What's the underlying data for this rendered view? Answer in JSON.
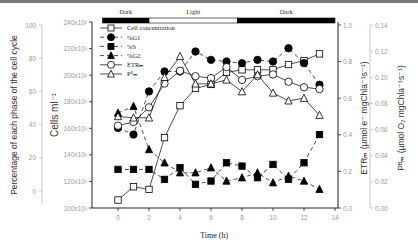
{
  "chart_data": {
    "type": "line",
    "title": "",
    "xlabel": "Time (h)",
    "x": [
      0,
      1,
      2,
      3,
      4,
      5,
      6,
      7,
      8,
      9,
      10,
      11,
      12,
      13
    ],
    "xlim": [
      -1,
      14
    ],
    "xticks": [
      "0",
      "2",
      "4",
      "6",
      "8",
      "10",
      "12",
      "14"
    ],
    "period_bar": [
      {
        "label": "Dark",
        "from": -1,
        "to": 2,
        "color": "#000000"
      },
      {
        "label": "Light",
        "from": 2,
        "to": 7.7,
        "color": "#ffffff"
      },
      {
        "label": "Dark",
        "from": 7.7,
        "to": 14,
        "color": "#000000"
      }
    ],
    "axes": {
      "percentage": {
        "label": "Percentage of each phase of the cell cycle",
        "ylim": [
          0,
          100
        ],
        "ticks": [
          "0",
          "20",
          "40",
          "60",
          "80",
          "100"
        ]
      },
      "cells": {
        "label": "Cells ml⁻¹",
        "ylim": [
          100000,
          240000
        ],
        "ticks": [
          "100x10³",
          "120x10³",
          "140x10³",
          "160x10³",
          "180x10³",
          "200x10³",
          "220x10³",
          "240x10³"
        ]
      },
      "etr": {
        "label": "ETRₘ (μmol e⁻ mgChla⁻¹s⁻¹)",
        "ylim": [
          0,
          1.0
        ],
        "ticks": [
          "0.0",
          "0.2",
          "0.4",
          "0.6",
          "0.8",
          "1.0"
        ]
      },
      "pbm": {
        "label": "Pᴮₘ (μmol O₂ mgChla⁻¹s⁻¹)",
        "ylim": [
          0,
          0.14
        ],
        "ticks": [
          "0.00",
          "0.02",
          "0.04",
          "0.06",
          "0.08",
          "0.10",
          "0.12",
          "0.14"
        ]
      }
    },
    "series": [
      {
        "name": "Cell concentration",
        "axis": "cells",
        "marker": "open-square",
        "line": "solid",
        "values": [
          106000,
          116000,
          114000,
          153000,
          177000,
          190000,
          193000,
          202000,
          204000,
          204000,
          204000,
          208000,
          211000,
          216000
        ]
      },
      {
        "name": "%G1",
        "axis": "percentage",
        "marker": "filled-circle",
        "line": "dashed",
        "values": [
          38,
          34,
          60,
          72,
          72,
          84,
          79,
          78,
          77,
          79,
          78,
          86,
          77,
          64
        ]
      },
      {
        "name": "%S",
        "axis": "percentage",
        "marker": "filled-square",
        "line": "dashed",
        "values": [
          13,
          13,
          13,
          7,
          14,
          4,
          6,
          17,
          15,
          8,
          16,
          7,
          17,
          34
        ]
      },
      {
        "name": "%G2",
        "axis": "percentage",
        "marker": "filled-triangle",
        "line": "dashed",
        "values": [
          47,
          51,
          25,
          17,
          11,
          11,
          14,
          6,
          8,
          11,
          5,
          9,
          6,
          1
        ]
      },
      {
        "name": "ETRₘ",
        "axis": "etr",
        "marker": "open-circle",
        "line": "solid",
        "values": [
          0.45,
          0.47,
          0.55,
          0.68,
          0.75,
          0.72,
          0.71,
          0.77,
          0.7,
          0.72,
          0.73,
          0.69,
          0.66,
          0.65
        ]
      },
      {
        "name": "Pᴮₘ",
        "axis": "pbm",
        "marker": "open-triangle",
        "line": "solid",
        "values": [
          0.07,
          0.069,
          0.069,
          0.1,
          0.116,
          0.095,
          0.095,
          0.098,
          0.089,
          0.102,
          0.088,
          0.082,
          0.084,
          0.071
        ]
      }
    ],
    "legend": {
      "position": "upper-left",
      "entries": [
        "Cell concentration",
        "%G1",
        "%S",
        "%G2",
        "ETRₘ",
        "Pᴮₘ"
      ]
    },
    "grid": false
  }
}
